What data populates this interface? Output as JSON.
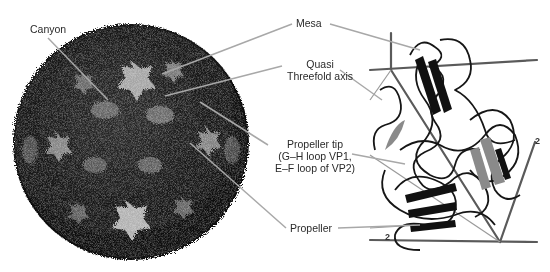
{
  "figure": {
    "left_panel": {
      "subject": "virus capsid surface",
      "labels": {
        "canyon": "Canyon"
      }
    },
    "center_labels": {
      "mesa": "Mesa",
      "quasi_line1": "Quasi",
      "quasi_line2": "Threefold axis",
      "propeller_tip_line1": "Propeller tip",
      "propeller_tip_line2": "(G–H loop VP1,",
      "propeller_tip_line3": "E–F loop of VP2)",
      "propeller": "Propeller"
    },
    "right_panel": {
      "subject": "protomer ribbon diagram",
      "axis_labels": {
        "twofold_bottom": "2",
        "twofold_right": "2"
      }
    },
    "colors": {
      "leader_line": "#a8a8a8",
      "capsid_dark": "#111111",
      "capsid_light": "#d8d8d8",
      "ribbon": "#1a1a1a",
      "axis_rod": "#555555"
    }
  }
}
